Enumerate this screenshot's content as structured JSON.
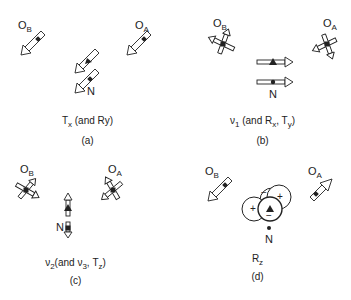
{
  "atoms": {
    "oxygen_b": "O",
    "oxygen_b_sub": "B",
    "oxygen_a": "O",
    "oxygen_a_sub": "A",
    "nitrogen": "N"
  },
  "panels": [
    {
      "id": "a",
      "title_main": "T",
      "title_sub": "x",
      "title_rest": " (and Ry)",
      "caption": "(a)"
    },
    {
      "id": "b",
      "title_main": "ν",
      "title_sub": "1",
      "title_rest": " (and R",
      "title_sub2": "x",
      "title_rest2": ", T",
      "title_sub3": "y",
      "title_end": ")",
      "caption": "(b)"
    },
    {
      "id": "c",
      "title_main": "ν",
      "title_sub": "2",
      "title_rest": "(and ν",
      "title_sub2": "3",
      "title_rest2": ", T",
      "title_sub3": "z",
      "title_end": ")",
      "caption": "(c)"
    },
    {
      "id": "d",
      "title_main": "R",
      "title_sub": "z",
      "caption": "(d)",
      "lobe_signs": [
        "−",
        "+",
        "+",
        "−"
      ]
    }
  ],
  "colors": {
    "line": "#222222",
    "fill": "#ffffff"
  }
}
